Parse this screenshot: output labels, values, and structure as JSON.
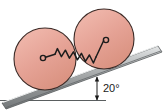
{
  "figure": {
    "background_color": "#ffffff",
    "width": 164,
    "height": 111
  },
  "incline": {
    "name": "inclined-plane",
    "angle_label": "20°",
    "angle_value": 20,
    "angle_unit": "degrees",
    "surface_color_light": "#d8dadb",
    "surface_color_mid": "#9a9d9e",
    "surface_color_dark": "#6f7375",
    "edge_color": "#55595b"
  },
  "reference_line": {
    "name": "horizontal-reference-line",
    "color": "#5a5e60",
    "label": ""
  },
  "angle_marker": {
    "name": "angle-arc",
    "color": "#1a1a1a",
    "label": "20°"
  },
  "disks": [
    {
      "name": "lower-disk",
      "label": "",
      "fill_color": "#e5a295",
      "stroke_color": "#3b2a26",
      "cx": 45,
      "cy": 59,
      "r": 31
    },
    {
      "name": "upper-disk",
      "label": "",
      "fill_color": "#e5a295",
      "stroke_color": "#3b2a26",
      "cx": 104,
      "cy": 39,
      "r": 30
    }
  ],
  "spring": {
    "name": "connecting-spring",
    "color": "#1c1c1c",
    "coil_count": 11,
    "hook_left": {
      "cx": 43,
      "cy": 58,
      "r": 2.6
    },
    "hook_right": {
      "cx": 106,
      "cy": 40,
      "r": 2.6
    },
    "label": ""
  },
  "labels": {
    "angle": "20°"
  }
}
